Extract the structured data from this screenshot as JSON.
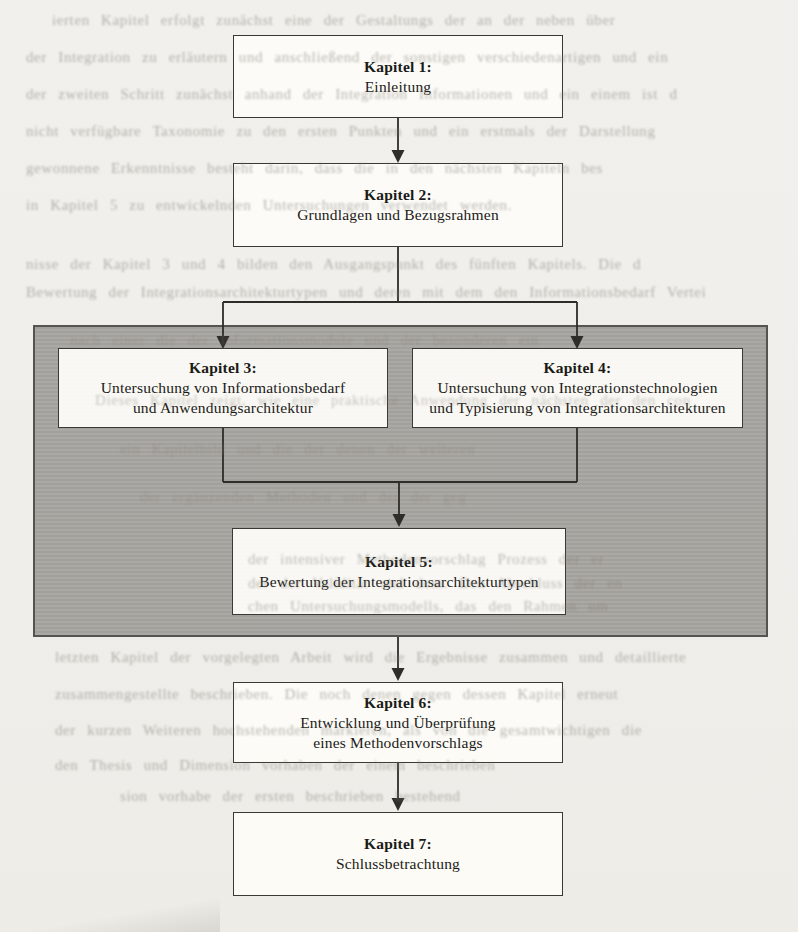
{
  "figure": {
    "type": "flowchart",
    "colors": {
      "page_background": "#f0efeb",
      "panel_gray": "#a8a6a1",
      "box_fill": "#fcfbf7",
      "line_color": "#2e2d2a"
    },
    "nodes": [
      {
        "id": "kapitel-1",
        "title": "Kapitel 1:",
        "lines": [
          "Einleitung"
        ]
      },
      {
        "id": "kapitel-2",
        "title": "Kapitel 2:",
        "lines": [
          "Grundlagen und Bezugsrahmen"
        ]
      },
      {
        "id": "kapitel-3",
        "title": "Kapitel 3:",
        "lines": [
          "Untersuchung von Informationsbedarf",
          "und Anwendungsarchitektur"
        ]
      },
      {
        "id": "kapitel-4",
        "title": "Kapitel 4:",
        "lines": [
          "Untersuchung von Integrationstechnologien",
          "und Typisierung von Integrationsarchitekturen"
        ]
      },
      {
        "id": "kapitel-5",
        "title": "Kapitel 5:",
        "lines": [
          "Bewertung der  Integrationsarchitekturtypen"
        ]
      },
      {
        "id": "kapitel-6",
        "title": "Kapitel 6:",
        "lines": [
          "Entwicklung und Überprüfung",
          "eines Methodenvorschlags"
        ]
      },
      {
        "id": "kapitel-7",
        "title": "Kapitel 7:",
        "lines": [
          "Schlussbetrachtung"
        ]
      }
    ],
    "edges": [
      "kapitel-1 -> kapitel-2",
      "kapitel-2 -> kapitel-3",
      "kapitel-2 -> kapitel-4",
      "kapitel-3 -> kapitel-5",
      "kapitel-4 -> kapitel-5",
      "kapitel-5 -> kapitel-6",
      "kapitel-6 -> kapitel-7"
    ]
  },
  "background_bleed_text": {
    "fragments": [
      "ierten Kapitel erfolgt zunächst eine der Gestaltungs der an der neben über",
      "der Integration zu erläutern und anschließend der sonstigen verschiedenartigen und ein",
      "der zweiten Schritt zunächst anhand der Integration Informationen und ein einem ist d",
      "nicht verfügbare Taxonomie zu den ersten Punkten und ein erstmals der Darstellung",
      "gewonnene Erkenntnisse besteht darin, dass die in den nächsten Kapiteln bes",
      "in Kapitel 5 zu entwickelnden Untersuchungen verwendet werden.",
      "nisse der Kapitel 3 und 4 bilden den Ausgangspunkt des fünften Kapitels. Die d",
      "Bewertung der Integrationsarchitekturtypen und deren mit dem den Informationsbedarf Vertei",
      "nach einer die der Informationsmodule und der besonderen ein",
      "Dieses Kapitel zeigt, wie eine praktische Anwendung der nächsten der den con",
      "ein Kapitelbild und die der denen der weiteren",
      "der ergänzenden Methoden und der der geg",
      "der intensiver Methodenvorschlag Prozess der er",
      "der der Validität und dem. Den Abschluss der en",
      "chen Untersuchungsmodells, das den Rahmen um",
      "letzten Kapitel der vorgelegten Arbeit wird die Ergebnisse zusammen und detaillierte",
      "zusammengestellte beschrieben. Die noch denen gegen dessen Kapitel erneut",
      "der kurzen Weiteren hochstehenden markieren, als von die gesamtwichtigen die",
      "den Thesis und Dimension vorhaben der einem beschrieben",
      "sion vorhabe der ersten beschrieben bestehend"
    ]
  }
}
